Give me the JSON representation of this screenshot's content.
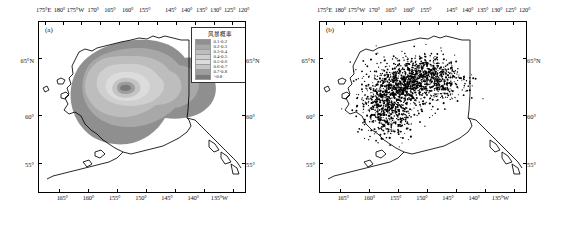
{
  "figure": {
    "panels": [
      {
        "tag": "(a)",
        "type": "contour-probability-map"
      },
      {
        "tag": "(b)",
        "type": "point-density-map"
      }
    ]
  },
  "axes": {
    "top_ticks": [
      {
        "label": "175°E",
        "pos": 3
      },
      {
        "label": "180°",
        "pos": 11.5
      },
      {
        "label": "175°W",
        "pos": 20
      },
      {
        "label": "170°",
        "pos": 29.5
      },
      {
        "label": "165°",
        "pos": 38.5
      },
      {
        "label": "160°",
        "pos": 48
      },
      {
        "label": "155°",
        "pos": 57
      },
      {
        "label": "145°",
        "pos": 71
      },
      {
        "label": "140°",
        "pos": 79.5
      },
      {
        "label": "135°",
        "pos": 87.5
      },
      {
        "label": "130°",
        "pos": 95
      },
      {
        "label": "125°",
        "pos": 102.5
      },
      {
        "label": "120°",
        "pos": 110
      }
    ],
    "bottom_ticks": [
      {
        "label": "165°",
        "pos": 13
      },
      {
        "label": "160°",
        "pos": 27
      },
      {
        "label": "155°",
        "pos": 41
      },
      {
        "label": "150°",
        "pos": 55
      },
      {
        "label": "145°",
        "pos": 69
      },
      {
        "label": "140°",
        "pos": 83
      },
      {
        "label": "135°W",
        "pos": 97
      }
    ],
    "left_ticks": [
      {
        "label": "65°N",
        "pos": 23
      },
      {
        "label": "60°",
        "pos": 56
      },
      {
        "label": "55°",
        "pos": 84
      }
    ],
    "right_ticks": [
      {
        "label": "65°N",
        "pos": 23
      },
      {
        "label": "60°",
        "pos": 56
      },
      {
        "label": "55°",
        "pos": 84
      }
    ]
  },
  "legend": {
    "title": "风暴概率",
    "items": [
      {
        "label": "0.1-0.2",
        "color": "#8f8f8f"
      },
      {
        "label": "0.2-0.3",
        "color": "#a8a8a8"
      },
      {
        "label": "0.3-0.4",
        "color": "#bdbdbd"
      },
      {
        "label": "0.4-0.5",
        "color": "#cfcfcf"
      },
      {
        "label": "0.5-0.6",
        "color": "#dcdcdc"
      },
      {
        "label": "0.6-0.7",
        "color": "#c4c4c4"
      },
      {
        "label": "0.7-0.8",
        "color": "#9d9d9d"
      },
      {
        "label": ">0.8",
        "color": "#7a7a7a"
      }
    ]
  },
  "chart_data": {
    "type": "heatmap",
    "title": "",
    "xlabel": "",
    "ylabel": "",
    "xlim": [
      175,
      120
    ],
    "ylim": [
      52,
      70
    ],
    "grid": false,
    "legend_position": "inside-top-right",
    "panels": [
      {
        "tag": "(a)",
        "kind": "filled-contour",
        "variable": "风暴概率",
        "levels": [
          0.1,
          0.2,
          0.3,
          0.4,
          0.5,
          0.6,
          0.7,
          0.8
        ],
        "level_colors": [
          "#8f8f8f",
          "#a8a8a8",
          "#bdbdbd",
          "#cfcfcf",
          "#dcdcdc",
          "#c4c4c4",
          "#9d9d9d",
          "#7a7a7a"
        ],
        "peak_center": {
          "lon": -154.5,
          "lat": 60.2
        },
        "peak_value": 0.8
      },
      {
        "tag": "(b)",
        "kind": "scatter",
        "marker_color": "#000000",
        "point_count_approx": 1800,
        "cluster_center": {
          "lon": -155.5,
          "lat": 61.0
        }
      }
    ]
  }
}
